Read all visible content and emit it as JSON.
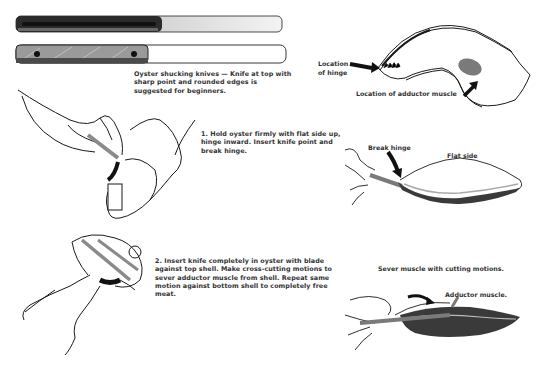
{
  "knives": {
    "caption": "Oyster shucking knives — Knife at top with sharp point and rounded edges is suggested for beginners."
  },
  "steps": [
    {
      "text": "1. Hold oyster firmly with flat side up, hinge inward. Insert knife point and break hinge."
    },
    {
      "text": "2. Insert knife completely in oyster with blade against top shell. Make cross-cutting motions to sever adductor muscle from shell. Repeat same motion against bottom shell to completely free meat."
    }
  ],
  "diagram_shell": {
    "hinge_label_line1": "Location",
    "hinge_label_line2": "of hinge",
    "muscle_label": "Location of adductor muscle"
  },
  "diagram_break": {
    "break_label": "Break hinge",
    "flat_label": "Flat side"
  },
  "diagram_sever": {
    "caption": "Sever muscle with cutting motions.",
    "muscle_label": "Adductor muscle."
  },
  "colors": {
    "ink": "#1a1a1a",
    "knife_gray": "#8a8a8a",
    "muscle_gray": "#7a7a7a"
  }
}
